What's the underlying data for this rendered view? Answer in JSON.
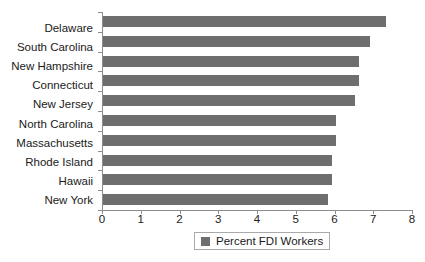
{
  "chart_data": {
    "type": "bar",
    "orientation": "horizontal",
    "title": "",
    "xlabel": "",
    "ylabel": "",
    "xlim": [
      0,
      8
    ],
    "xticks": [
      "0",
      "1",
      "2",
      "3",
      "4",
      "5",
      "6",
      "7",
      "8"
    ],
    "grid": false,
    "legend": {
      "position": "bottom",
      "entries": [
        "Percent FDI Workers"
      ]
    },
    "categories": [
      "Delaware",
      "South Carolina",
      "New Hampshire",
      "Connecticut",
      "New Jersey",
      "North Carolina",
      "Massachusetts",
      "Rhode Island",
      "Hawaii",
      "New York"
    ],
    "series": [
      {
        "name": "Percent FDI Workers",
        "color": "#6e6e6e",
        "values": [
          7.3,
          6.9,
          6.6,
          6.6,
          6.5,
          6.0,
          6.0,
          5.9,
          5.9,
          5.8
        ]
      }
    ]
  },
  "legend": {
    "label": "Percent FDI Workers"
  },
  "colors": {
    "bar": "#6e6e6e",
    "axis": "#8d8d8d",
    "text": "#1a1a1a",
    "background": "#ffffff"
  }
}
